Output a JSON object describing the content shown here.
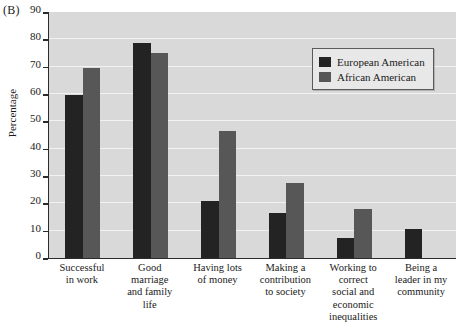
{
  "panel": {
    "label": "(B)"
  },
  "legend": {
    "position": "top-right-inside",
    "entries": [
      {
        "name": "European American",
        "color": "#232323",
        "swatch_icon": "square-swatch-icon"
      },
      {
        "name": "African American",
        "color": "#575757",
        "swatch_icon": "square-swatch-icon"
      }
    ]
  },
  "chart_data": {
    "type": "bar",
    "title": "",
    "xlabel": "",
    "ylabel": "Percentage",
    "ylim": [
      0,
      90
    ],
    "yticks": [
      0,
      10,
      20,
      30,
      40,
      50,
      60,
      70,
      80,
      90
    ],
    "grid": true,
    "categories": [
      "Successful in work",
      "Good marriage and family life",
      "Having lots of money",
      "Making a contribution to society",
      "Working to correct social and economic inequalities",
      "Being a leader in my community"
    ],
    "category_lines": [
      [
        "Successful",
        "in work"
      ],
      [
        "Good",
        "marriage",
        "and family",
        "life"
      ],
      [
        "Having lots",
        "of money"
      ],
      [
        "Making a",
        "contribution",
        "to society"
      ],
      [
        "Working to",
        "correct",
        "social and",
        "economic",
        "inequalities"
      ],
      [
        "Being a",
        "leader in my",
        "community"
      ]
    ],
    "series": [
      {
        "name": "European American",
        "color": "#232323",
        "values": [
          59.5,
          78.5,
          21,
          16.5,
          7.5,
          10.5
        ]
      },
      {
        "name": "African American",
        "color": "#575757",
        "values": [
          69.5,
          75,
          46.5,
          27.5,
          18,
          null
        ]
      }
    ]
  }
}
